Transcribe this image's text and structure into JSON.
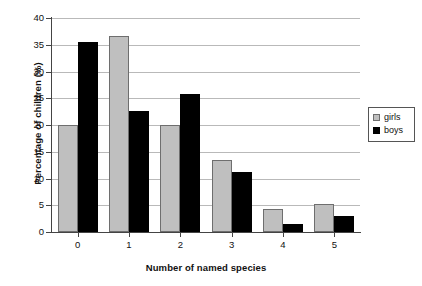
{
  "chart_data": {
    "type": "bar",
    "title": "",
    "xlabel": "Number of named species",
    "ylabel": "Percentage of children (%)",
    "categories": [
      "0",
      "1",
      "2",
      "3",
      "4",
      "5"
    ],
    "series": [
      {
        "name": "girls",
        "color": "#bfbfbf",
        "values": [
          20.0,
          36.7,
          20.0,
          13.4,
          4.3,
          5.2
        ]
      },
      {
        "name": "boys",
        "color": "#000000",
        "values": [
          35.5,
          22.6,
          25.8,
          11.2,
          1.5,
          3.0
        ]
      }
    ],
    "ylim": [
      0,
      40
    ],
    "yticks": [
      0,
      5,
      10,
      15,
      20,
      25,
      30,
      35,
      40
    ],
    "ytick_labels": [
      "0",
      "5",
      "10",
      "15",
      "20",
      "25",
      "30",
      "35",
      "40"
    ],
    "grid": true,
    "grid_axis": "y",
    "legend_position": "right"
  },
  "legend": {
    "entries": [
      {
        "label": "girls",
        "swatch": "girls-swatch-icon"
      },
      {
        "label": "boys",
        "swatch": "boys-swatch-icon"
      }
    ]
  }
}
